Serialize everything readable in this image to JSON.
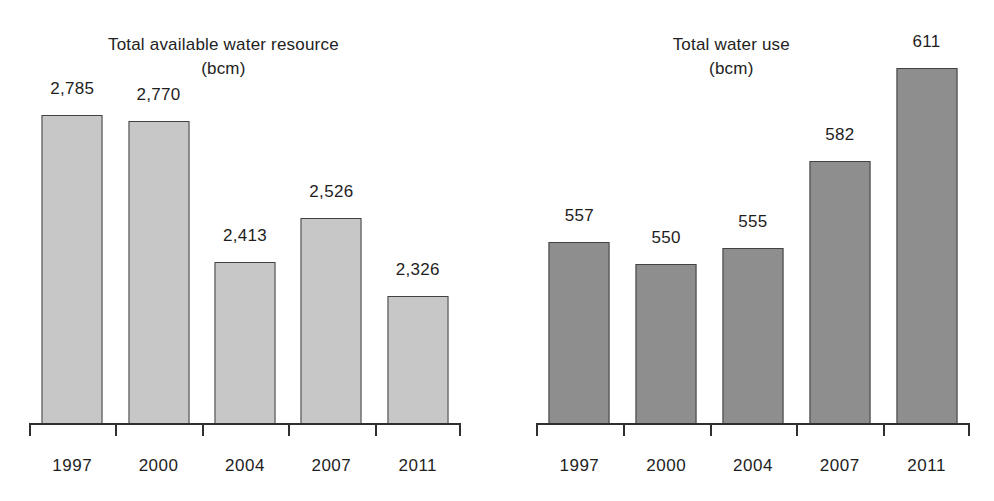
{
  "figure": {
    "background": "#ffffff",
    "text_color": "#1e1e1e",
    "axis_color": "#2f2f2f"
  },
  "chart_data": [
    {
      "type": "bar",
      "title": "Total available water resource",
      "subtitle": "(bcm)",
      "categories": [
        "1997",
        "2000",
        "2004",
        "2007",
        "2011"
      ],
      "values": [
        2785,
        2770,
        2413,
        2526,
        2326
      ],
      "value_labels": [
        "2,785",
        "2,770",
        "2,413",
        "2,526",
        "2,326"
      ],
      "xlabel": "",
      "ylabel": "",
      "ylim": [
        2000,
        2900
      ],
      "grid": false,
      "legend": "none",
      "bar_color": "#c7c7c7",
      "bar_border_color": "#424242"
    },
    {
      "type": "bar",
      "title": "Total water use",
      "subtitle": "(bcm)",
      "categories": [
        "1997",
        "2000",
        "2004",
        "2007",
        "2011"
      ],
      "values": [
        557,
        550,
        555,
        582,
        611
      ],
      "value_labels": [
        "557",
        "550",
        "555",
        "582",
        "611"
      ],
      "xlabel": "",
      "ylabel": "",
      "ylim": [
        500,
        615
      ],
      "grid": false,
      "legend": "none",
      "bar_color": "#8e8e8e",
      "bar_border_color": "#424242"
    }
  ]
}
